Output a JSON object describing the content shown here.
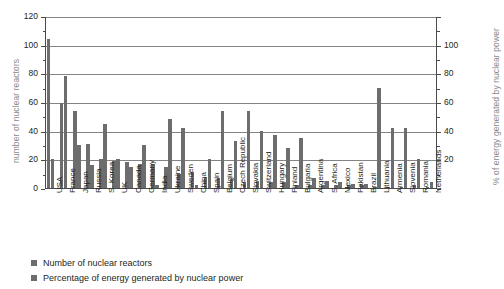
{
  "chart_data": {
    "type": "bar",
    "title": "",
    "subtitle": "",
    "xlabel": "",
    "ylabel": "number of nuclear reactors",
    "ylabel_right": "% of energy generated by nuclear power",
    "ylim": [
      0,
      120
    ],
    "ylim_right": [
      0,
      120
    ],
    "yticks": [
      0,
      20,
      40,
      60,
      80,
      100,
      120
    ],
    "yticks_right": [
      20,
      40,
      60,
      80,
      100
    ],
    "grid": true,
    "legend_position": "bottom-left",
    "categories": [
      "USA",
      "France",
      "Japan",
      "Russia",
      "S. Korea",
      "UK",
      "Canada",
      "Germany",
      "India",
      "Ukraine",
      "Sweden",
      "China",
      "Spain",
      "Belgium",
      "Czech Republic",
      "Slovakia",
      "Switzerland",
      "Hungary",
      "Finland",
      "Bulgaria",
      "Argentina",
      "S. Africa",
      "Mexico",
      "Pakistan",
      "Brazil",
      "Lithuania",
      "Armenia",
      "Slovenia",
      "Romania",
      "Netherlands"
    ],
    "series": [
      {
        "name": "Number of nuclear reactors",
        "color": "#6d6d6d",
        "values": [
          104,
          59,
          54,
          31,
          20,
          19,
          18,
          17,
          17,
          15,
          10,
          11,
          8,
          7,
          6,
          4,
          5,
          4,
          4,
          2,
          2,
          2,
          2,
          2,
          2,
          1,
          1,
          1,
          2,
          1
        ]
      },
      {
        "name": "Percentage of energy generated by nuclear power",
        "color": "#6d6d6d",
        "values": [
          20,
          78,
          30,
          16,
          45,
          20,
          15,
          30,
          2,
          48,
          42,
          2,
          20,
          54,
          33,
          54,
          40,
          37,
          28,
          35,
          7,
          5,
          4,
          3,
          3,
          70,
          42,
          42,
          20,
          4
        ]
      }
    ]
  },
  "legend": {
    "items": [
      {
        "label": "Number of nuclear reactors"
      },
      {
        "label": "Percentage of energy generated by nuclear power"
      }
    ]
  }
}
